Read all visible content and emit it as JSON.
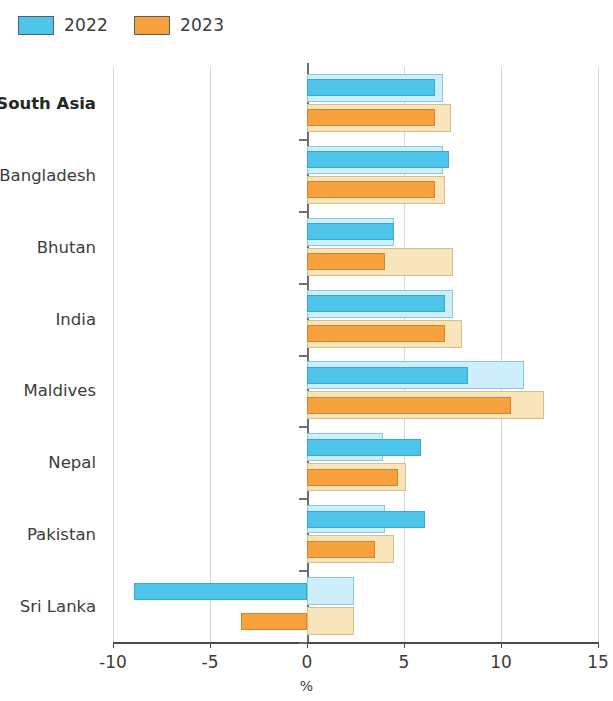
{
  "legend": {
    "position": "top-left",
    "entries": [
      {
        "label": "2022",
        "color": "#4ec5ea",
        "name": "legend-2022"
      },
      {
        "label": "2023",
        "color": "#f6a13c",
        "name": "legend-2023"
      }
    ]
  },
  "axis": {
    "x_title": "%",
    "ticks": [
      "-10",
      "-5",
      "0",
      "5",
      "10",
      "15"
    ]
  },
  "chart_data": {
    "type": "bar",
    "orientation": "horizontal",
    "title": "",
    "subtitle": "",
    "xlabel": "%",
    "ylabel": "",
    "xlim": [
      -10,
      15
    ],
    "xticks": [
      -10,
      -5,
      0,
      5,
      10,
      15
    ],
    "grid": true,
    "legend_position": "top-left",
    "categories": [
      "South Asia",
      "Bangladesh",
      "Bhutan",
      "India",
      "Maldives",
      "Nepal",
      "Pakistan",
      "Sri Lanka"
    ],
    "bold_categories": [
      "South Asia"
    ],
    "series": [
      {
        "name": "2022",
        "style": "outer",
        "color": "#cdeefa",
        "values": [
          7.0,
          7.0,
          4.5,
          7.5,
          11.2,
          3.9,
          4.0,
          2.4
        ]
      },
      {
        "name": "2022",
        "style": "inner",
        "color": "#4ec5ea",
        "values": [
          6.6,
          7.3,
          4.5,
          7.1,
          8.3,
          5.9,
          6.1,
          -8.9
        ]
      },
      {
        "name": "2023",
        "style": "outer",
        "color": "#f9e5bb",
        "values": [
          7.4,
          7.1,
          7.5,
          8.0,
          12.2,
          5.1,
          4.5,
          2.4
        ]
      },
      {
        "name": "2023",
        "style": "inner",
        "color": "#f6a13c",
        "values": [
          6.6,
          6.6,
          4.0,
          7.1,
          10.5,
          4.7,
          3.5,
          -3.4
        ]
      }
    ]
  }
}
